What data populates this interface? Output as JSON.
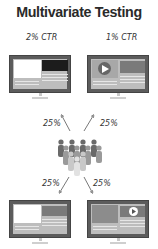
{
  "title": "Multivariate Testing",
  "variants": [
    {
      "label": "2% CTR",
      "position": "top-left",
      "layout": "text-left-dark-image-right"
    },
    {
      "label": "1% CTR",
      "position": "top-right",
      "layout": "video-left-image-right"
    },
    {
      "label": "",
      "position": "bottom-left",
      "layout": "text-left-image-right"
    },
    {
      "label": "",
      "position": "bottom-right",
      "layout": "image-left-video-right"
    }
  ],
  "splits": {
    "top_left": "25%",
    "top_right": "25%",
    "bottom_left": "25%",
    "bottom_right": "25%"
  },
  "icons": {
    "audience": "people-group-icon",
    "play": "play-icon",
    "arrow": "arrow-icon"
  },
  "colors": {
    "monitor_frame": "#5c5c5c",
    "screen_bg": "#bdbdbd",
    "dark_panel": "#1c1c1c",
    "text": "#2a2a2a"
  }
}
